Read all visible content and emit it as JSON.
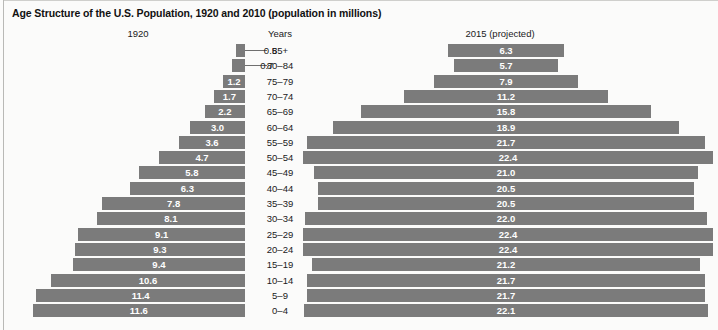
{
  "title": "Age Structure of the U.S. Population, 1920 and 2010 (population in millions)",
  "headers": {
    "left": "1920",
    "center": "Years",
    "right": "2015 (projected)"
  },
  "footer": "",
  "colors": {
    "bar": "#7b7b7b",
    "background": "#fbfbfa",
    "text": "#1a1a1a",
    "bar_label": "#ffffff"
  },
  "chart_data": {
    "type": "bar",
    "title": "Age Structure of the U.S. Population, 1920 and 2010 (population in millions)",
    "xlabel": "Population (millions)",
    "ylabel": "Years",
    "categories": [
      "85+",
      "80–84",
      "75–79",
      "70–74",
      "65–69",
      "60–64",
      "55–59",
      "50–54",
      "45–49",
      "40–44",
      "35–39",
      "30–34",
      "25–29",
      "20–24",
      "15–19",
      "10–14",
      "5–9",
      "0–4"
    ],
    "series": [
      {
        "name": "1920",
        "side": "left",
        "values": [
          0.5,
          0.7,
          1.2,
          1.7,
          2.2,
          3.0,
          3.6,
          4.7,
          5.8,
          6.3,
          7.8,
          8.1,
          9.1,
          9.3,
          9.4,
          10.6,
          11.4,
          11.6
        ],
        "labels": [
          "0.5",
          "0.7",
          "1.2",
          "1.7",
          "2.2",
          "3.0",
          "3.6",
          "4.7",
          "5.8",
          "6.3",
          "7.8",
          "8.1",
          "9.1",
          "9.3",
          "9.4",
          "10.6",
          "11.4",
          "11.6"
        ],
        "label_outside": [
          true,
          true,
          false,
          false,
          false,
          false,
          false,
          false,
          false,
          false,
          false,
          false,
          false,
          false,
          false,
          false,
          false,
          false
        ]
      },
      {
        "name": "2015 (projected)",
        "side": "right",
        "values": [
          6.3,
          5.7,
          7.9,
          11.2,
          15.8,
          18.9,
          21.7,
          22.4,
          21.0,
          20.5,
          20.5,
          22.0,
          22.4,
          22.4,
          21.2,
          21.7,
          21.7,
          22.1
        ],
        "labels": [
          "6.3",
          "5.7",
          "7.9",
          "11.2",
          "15.8",
          "18.9",
          "21.7",
          "22.4",
          "21.0",
          "20.5",
          "20.5",
          "22.0",
          "22.4",
          "22.4",
          "21.2",
          "21.7",
          "21.7",
          "22.1"
        ],
        "label_outside": [
          false,
          false,
          false,
          false,
          false,
          false,
          false,
          false,
          false,
          false,
          false,
          false,
          false,
          false,
          false,
          false,
          false,
          false
        ]
      }
    ],
    "xlim_left": [
      0,
      11.6
    ],
    "xlim_right": [
      0,
      22.4
    ],
    "grid": false,
    "legend": "none"
  }
}
